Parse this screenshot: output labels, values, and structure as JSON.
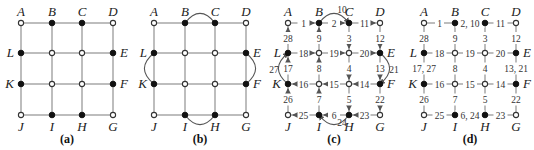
{
  "figure": {
    "vertex_names": [
      "A",
      "B",
      "C",
      "D",
      "E",
      "F",
      "G",
      "H",
      "I",
      "J",
      "K",
      "L"
    ],
    "odd_vertices": [
      "B",
      "C",
      "E",
      "F",
      "H",
      "I",
      "K",
      "L"
    ],
    "panels": [
      {
        "id": "a",
        "caption": "(a)",
        "added_arcs": []
      },
      {
        "id": "b",
        "caption": "(b)",
        "added_arcs": [
          [
            "B",
            "C"
          ],
          [
            "E",
            "F"
          ],
          [
            "H",
            "I"
          ],
          [
            "K",
            "L"
          ]
        ]
      },
      {
        "id": "c",
        "caption": "(c)",
        "added_arcs": [
          [
            "B",
            "C"
          ],
          [
            "E",
            "F"
          ],
          [
            "H",
            "I"
          ],
          [
            "K",
            "L"
          ]
        ],
        "circuit_steps": [
          {
            "n": "1",
            "from": "A",
            "to": "B"
          },
          {
            "n": "2",
            "from": "B",
            "to": "C"
          },
          {
            "n": "3",
            "from": "C",
            "to": "CE_mid"
          },
          {
            "n": "4",
            "from": "CE_mid",
            "to": "HF_mid"
          },
          {
            "n": "5",
            "from": "HF_mid",
            "to": "H"
          },
          {
            "n": "6",
            "from": "H",
            "to": "I"
          },
          {
            "n": "7",
            "from": "I",
            "to": "BI_low"
          },
          {
            "n": "8",
            "from": "BI_low",
            "to": "BI_up"
          },
          {
            "n": "9",
            "from": "BI_up",
            "to": "B"
          },
          {
            "n": "10",
            "from": "B",
            "to": "C",
            "arc": true
          },
          {
            "n": "11",
            "from": "C",
            "to": "D"
          },
          {
            "n": "12",
            "from": "D",
            "to": "E"
          },
          {
            "n": "13",
            "from": "E",
            "to": "F"
          },
          {
            "n": "14",
            "from": "F",
            "to": "HF_mid"
          },
          {
            "n": "15",
            "from": "HF_mid",
            "to": "BI_low"
          },
          {
            "n": "16",
            "from": "BI_low",
            "to": "K"
          },
          {
            "n": "17",
            "from": "K",
            "to": "L"
          },
          {
            "n": "18",
            "from": "L",
            "to": "BI_up"
          },
          {
            "n": "19",
            "from": "BI_up",
            "to": "CE_mid"
          },
          {
            "n": "20",
            "from": "CE_mid",
            "to": "E"
          },
          {
            "n": "21",
            "from": "E",
            "to": "F",
            "arc": true
          },
          {
            "n": "22",
            "from": "F",
            "to": "G"
          },
          {
            "n": "23",
            "from": "G",
            "to": "H"
          },
          {
            "n": "24",
            "from": "H",
            "to": "I",
            "arc": true
          },
          {
            "n": "25",
            "from": "I",
            "to": "J"
          },
          {
            "n": "26",
            "from": "J",
            "to": "K"
          },
          {
            "n": "27",
            "from": "K",
            "to": "L",
            "arc": true
          },
          {
            "n": "28",
            "from": "L",
            "to": "A"
          }
        ]
      },
      {
        "id": "d",
        "caption": "(d)",
        "edge_labels": {
          "A-B": "1",
          "B-C": "2, 10",
          "C-D": "11",
          "L-m1": "18",
          "m1-m2": "19",
          "m2-E": "20",
          "K-m3": "16",
          "m3-m4": "15",
          "m4-F": "14",
          "J-I": "25",
          "I-H": "6, 24",
          "H-G": "23",
          "A-L": "28",
          "L-K": "17, 27",
          "K-J": "26",
          "B-m1": "9",
          "m1-m3": "8",
          "m3-I": "7",
          "C-m2": "3",
          "m2-m4": "4",
          "m4-H": "5",
          "D-E": "12",
          "E-F": "13, 21",
          "F-G": "22"
        }
      }
    ]
  }
}
